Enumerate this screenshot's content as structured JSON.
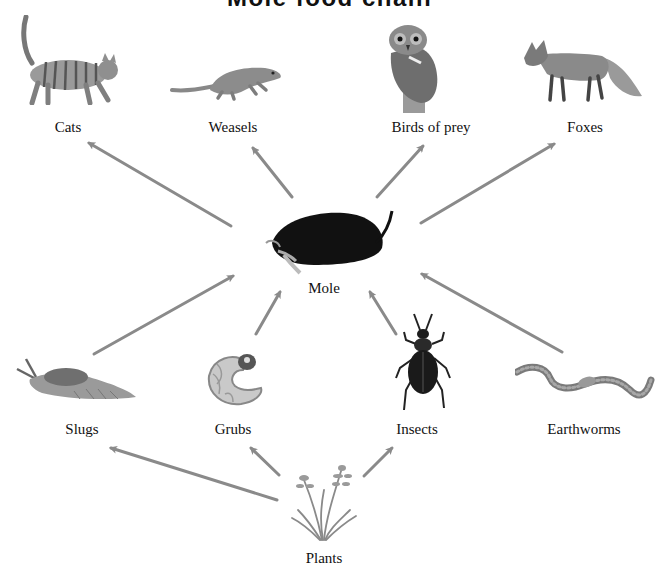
{
  "title": "Mole food chain",
  "arrow_color": "#8a8a8a",
  "nodes": {
    "cats": {
      "label": "Cats",
      "icon": "cat-icon"
    },
    "weasels": {
      "label": "Weasels",
      "icon": "weasel-icon"
    },
    "birds": {
      "label": "Birds of prey",
      "icon": "owl-icon"
    },
    "foxes": {
      "label": "Foxes",
      "icon": "fox-icon"
    },
    "mole": {
      "label": "Mole",
      "icon": "mole-icon"
    },
    "slugs": {
      "label": "Slugs",
      "icon": "slug-icon"
    },
    "grubs": {
      "label": "Grubs",
      "icon": "grub-icon"
    },
    "insects": {
      "label": "Insects",
      "icon": "beetle-icon"
    },
    "earthworms": {
      "label": "Earthworms",
      "icon": "earthworm-icon"
    },
    "plants": {
      "label": "Plants",
      "icon": "grass-icon"
    }
  },
  "edges": [
    {
      "from": "Mole",
      "to": "Cats"
    },
    {
      "from": "Mole",
      "to": "Weasels"
    },
    {
      "from": "Mole",
      "to": "Birds of prey"
    },
    {
      "from": "Mole",
      "to": "Foxes"
    },
    {
      "from": "Slugs",
      "to": "Mole"
    },
    {
      "from": "Grubs",
      "to": "Mole"
    },
    {
      "from": "Insects",
      "to": "Mole"
    },
    {
      "from": "Earthworms",
      "to": "Mole"
    },
    {
      "from": "Plants",
      "to": "Slugs"
    },
    {
      "from": "Plants",
      "to": "Grubs"
    },
    {
      "from": "Plants",
      "to": "Insects"
    }
  ]
}
